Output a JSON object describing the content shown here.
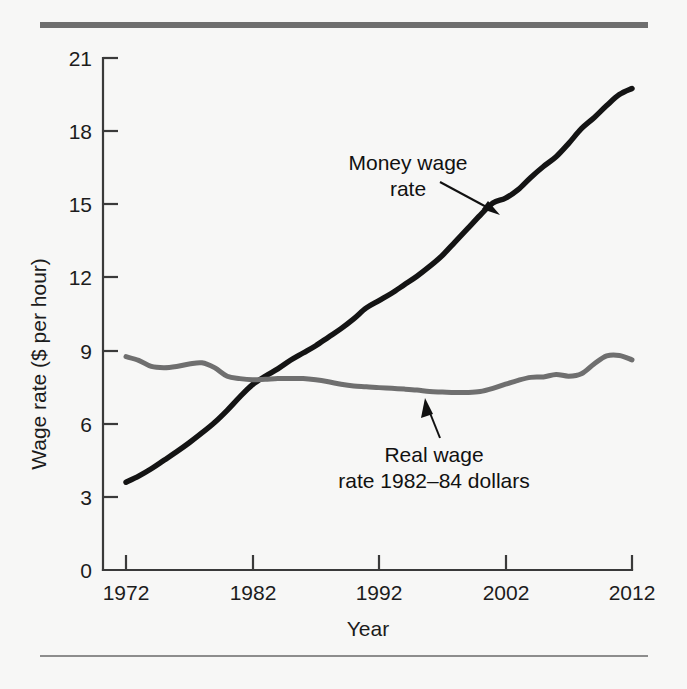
{
  "figure": {
    "background_color": "#f7f7f6",
    "top_rule_color": "#6e6e6e",
    "bottom_rule_color": "#8d8d8d"
  },
  "chart_data": {
    "type": "line",
    "title": "",
    "xlabel": "Year",
    "ylabel": "Wage rate ($ per hour)",
    "xlim": [
      1972,
      2012
    ],
    "ylim": [
      0,
      21
    ],
    "xticks": [
      1972,
      1982,
      1992,
      2002,
      2012
    ],
    "xticklabels": [
      "1972",
      "1982",
      "1992",
      "2002",
      "2012"
    ],
    "yticks": [
      0,
      3,
      6,
      9,
      12,
      15,
      18,
      21
    ],
    "yticklabels": [
      "0",
      "3",
      "6",
      "9",
      "12",
      "15",
      "18",
      "21"
    ],
    "grid": false,
    "legend_position": "none",
    "x": [
      1972,
      1973,
      1974,
      1975,
      1976,
      1977,
      1978,
      1979,
      1980,
      1981,
      1982,
      1983,
      1984,
      1985,
      1986,
      1987,
      1988,
      1989,
      1990,
      1991,
      1992,
      1993,
      1994,
      1995,
      1996,
      1997,
      1998,
      1999,
      2000,
      2001,
      2002,
      2003,
      2004,
      2005,
      2006,
      2007,
      2008,
      2009,
      2010,
      2011,
      2012
    ],
    "series": [
      {
        "name": "Money wage rate",
        "color": "#141414",
        "annotation": "Money wage\nrate",
        "values": [
          3.6,
          3.85,
          4.15,
          4.5,
          4.85,
          5.22,
          5.62,
          6.05,
          6.55,
          7.1,
          7.6,
          7.95,
          8.25,
          8.6,
          8.9,
          9.2,
          9.55,
          9.9,
          10.3,
          10.75,
          11.05,
          11.35,
          11.7,
          12.05,
          12.45,
          12.9,
          13.45,
          14.0,
          14.55,
          15.05,
          15.25,
          15.6,
          16.1,
          16.55,
          16.95,
          17.5,
          18.1,
          18.55,
          19.05,
          19.5,
          19.75
        ]
      },
      {
        "name": "Real wage rate 1982-84 dollars",
        "color": "#6f6f6f",
        "annotation": "Real wage\nrate 1982–84 dollars",
        "values": [
          8.75,
          8.6,
          8.35,
          8.3,
          8.35,
          8.45,
          8.5,
          8.3,
          7.95,
          7.85,
          7.8,
          7.82,
          7.85,
          7.85,
          7.85,
          7.8,
          7.72,
          7.62,
          7.55,
          7.52,
          7.48,
          7.45,
          7.42,
          7.38,
          7.32,
          7.3,
          7.28,
          7.28,
          7.32,
          7.45,
          7.62,
          7.78,
          7.9,
          7.92,
          8.02,
          7.95,
          8.05,
          8.45,
          8.78,
          8.8,
          8.62
        ]
      }
    ],
    "annotations": [
      {
        "id": "money-wage-annotation",
        "lines": [
          "Money wage",
          "rate"
        ],
        "points_to_year": 2003,
        "points_to_value": 15.6
      },
      {
        "id": "real-wage-annotation",
        "lines": [
          "Real wage",
          "rate 1982–84 dollars"
        ],
        "points_to_year": 1997,
        "points_to_value": 7.3
      }
    ]
  }
}
